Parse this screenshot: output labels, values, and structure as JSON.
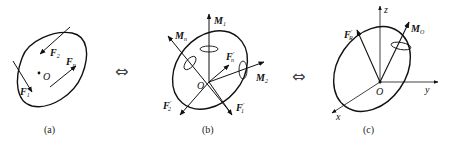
{
  "figure": {
    "panels": [
      {
        "id": "a",
        "caption": "(a)",
        "description": "Rigid body under spatial force system",
        "point": "O",
        "forces": [
          {
            "name": "F",
            "sub": "1"
          },
          {
            "name": "F",
            "sub": "2"
          },
          {
            "name": "F",
            "sub": "n"
          }
        ]
      },
      {
        "id": "b",
        "caption": "(b)",
        "description": "Concurrent forces and couples at O",
        "point": "O",
        "forces": [
          {
            "name": "F",
            "prime": "′",
            "sub": "1"
          },
          {
            "name": "F",
            "prime": "′",
            "sub": "2"
          },
          {
            "name": "F",
            "prime": "′",
            "sub": "n"
          }
        ],
        "moments": [
          {
            "name": "M",
            "sub": "1"
          },
          {
            "name": "M",
            "sub": "2"
          },
          {
            "name": "M",
            "sub": "n"
          }
        ]
      },
      {
        "id": "c",
        "caption": "(c)",
        "description": "Resultant force and resultant moment at O",
        "point": "O",
        "axes": {
          "x": "x",
          "y": "y",
          "z": "z"
        },
        "resultant_force": {
          "name": "F",
          "prime": "′",
          "sub": "R"
        },
        "resultant_moment": {
          "name": "M",
          "sub": "O"
        }
      }
    ],
    "equivalence_symbols": [
      "⇔",
      "⇔"
    ]
  }
}
